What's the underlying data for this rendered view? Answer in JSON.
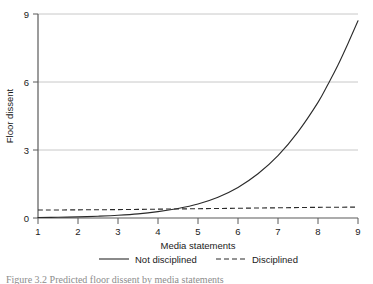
{
  "figure": {
    "caption_partial": "Figure 3.2 Predicted floor dissent by media statements"
  },
  "chart_data": {
    "type": "line",
    "title": "",
    "xlabel": "Media statements",
    "ylabel": "Floor dissent",
    "xlim": [
      1,
      9
    ],
    "ylim": [
      0,
      9
    ],
    "xticks": [
      1,
      2,
      3,
      4,
      5,
      6,
      7,
      8,
      9
    ],
    "yticks": [
      0,
      3,
      6,
      9
    ],
    "xtick_labels": [
      "1",
      "2",
      "3",
      "4",
      "5",
      "6",
      "7",
      "8",
      "9"
    ],
    "ytick_labels": [
      "0",
      "3",
      "6",
      "9"
    ],
    "grid": "horizontal",
    "grid_color": "#c8c8c8",
    "legend_position": "below",
    "axis_color": "#5a5a5a",
    "series": [
      {
        "name": "Not disciplined",
        "style": "solid",
        "color": "#2a2a2a",
        "x": [
          1,
          1.5,
          2,
          2.5,
          3,
          3.5,
          4,
          4.5,
          5,
          5.5,
          6,
          6.5,
          7,
          7.5,
          8,
          8.25,
          8.5,
          8.75,
          9
        ],
        "values": [
          0.02,
          0.03,
          0.05,
          0.08,
          0.12,
          0.18,
          0.28,
          0.42,
          0.62,
          0.92,
          1.35,
          1.95,
          2.75,
          3.8,
          5.1,
          5.9,
          6.75,
          7.7,
          8.7
        ]
      },
      {
        "name": "Disciplined",
        "style": "dashed",
        "color": "#2a2a2a",
        "x": [
          1,
          2,
          3,
          4,
          5,
          6,
          7,
          8,
          9
        ],
        "values": [
          0.35,
          0.36,
          0.37,
          0.39,
          0.41,
          0.43,
          0.45,
          0.47,
          0.48
        ]
      }
    ]
  },
  "legend": {
    "items": [
      {
        "label": "Not disciplined",
        "style": "solid"
      },
      {
        "label": "Disciplined",
        "style": "dashed"
      }
    ]
  }
}
